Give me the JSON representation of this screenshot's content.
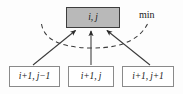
{
  "figure": {
    "colors": {
      "node_fill_active": "#b9b9b9",
      "node_fill_inactive": "#ffffff",
      "node_border_active": "#3d3d3d",
      "node_border_inactive": "#8a8a8a",
      "edge": "#3a3a3a",
      "dashed_arc": "#3a3a3a",
      "background": "#fdfdfd"
    },
    "top_node": {
      "label": "i, j"
    },
    "bottom_nodes": [
      {
        "label": "i+1, j−1"
      },
      {
        "label": "i+1, j"
      },
      {
        "label": "i+1, j+1"
      }
    ],
    "annotation": {
      "min_label": "min"
    },
    "edges": [
      {
        "from": "i+1, j−1",
        "to": "i, j",
        "style": "solid",
        "arrow": true
      },
      {
        "from": "i+1, j",
        "to": "i, j",
        "style": "solid",
        "arrow": true
      },
      {
        "from": "i+1, j+1",
        "to": "i, j",
        "style": "solid",
        "arrow": true
      }
    ],
    "arc": {
      "style": "dashed",
      "spans_edges": 3,
      "label": "min"
    }
  }
}
